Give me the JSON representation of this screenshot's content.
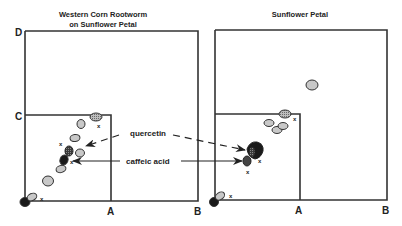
{
  "panels": [
    {
      "title_line1": "Western Corn Rootworm",
      "title_line2": "on Sunflower Petal",
      "labels": {
        "D": "D",
        "C": "C",
        "A": "A",
        "B": "B"
      },
      "spots": [
        {
          "id": "origin",
          "shade": "black",
          "x_mark": false
        },
        {
          "id": "s1",
          "shade": "light",
          "x_mark": true
        },
        {
          "id": "s2",
          "shade": "light",
          "x_mark": false
        },
        {
          "id": "s3",
          "shade": "light",
          "x_mark": false
        },
        {
          "id": "caffeic",
          "shade": "dark",
          "x_mark": true
        },
        {
          "id": "quercetin",
          "shade": "dark",
          "x_mark": true
        },
        {
          "id": "s6",
          "shade": "light",
          "x_mark": false
        },
        {
          "id": "s7",
          "shade": "light",
          "x_mark": false
        },
        {
          "id": "s8",
          "shade": "light",
          "x_mark": false
        },
        {
          "id": "top",
          "shade": "hatched",
          "x_mark": true
        }
      ]
    },
    {
      "title_line1": "Sunflower Petal",
      "labels": {
        "A": "A",
        "B": "B"
      },
      "spots": [
        {
          "id": "origin",
          "shade": "black",
          "x_mark": true
        },
        {
          "id": "cluster-dark",
          "shade": "black",
          "x_mark": true
        },
        {
          "id": "cluster-mid",
          "shade": "dark",
          "x_mark": true
        },
        {
          "id": "g1",
          "shade": "light",
          "x_mark": false
        },
        {
          "id": "g2",
          "shade": "light",
          "x_mark": false
        },
        {
          "id": "g3",
          "shade": "light",
          "x_mark": false
        },
        {
          "id": "g4",
          "shade": "hatched",
          "x_mark": true
        },
        {
          "id": "isolated",
          "shade": "light",
          "x_mark": false
        }
      ]
    }
  ],
  "annotations": {
    "quercetin": "quercetin",
    "caffeic_acid": "caffeic acid"
  },
  "x_mark": "x",
  "colors": {
    "light": "#c8c8c8",
    "dark": "#555555",
    "black": "#1a1a1a",
    "hatched": "#9a9a9a",
    "stroke": "#333333"
  }
}
